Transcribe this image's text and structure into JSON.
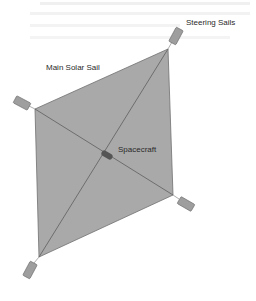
{
  "diagram": {
    "labels": {
      "steering_sails": "Steering Sails",
      "main_solar_sail": "Main Solar Sail",
      "spacecraft": "Spacecraft"
    },
    "colors": {
      "background": "#ffffff",
      "sail_fill": "#a9a9a9",
      "sail_stroke": "#6e6e6e",
      "rigging": "#6a6a6a",
      "steering_sail_fill": "#9e9e9e",
      "spacecraft_fill": "#555555",
      "label_text": "#2a2a2a"
    },
    "main_sail_vertices": {
      "top": [
        168,
        49
      ],
      "right": [
        173,
        195
      ],
      "bottom": [
        39,
        257
      ],
      "left": [
        35,
        109
      ]
    },
    "spacecraft_position": [
      107,
      155
    ],
    "steering_sails": [
      {
        "id": "top",
        "center": [
          176,
          36
        ],
        "angle": -62
      },
      {
        "id": "left",
        "center": [
          23,
          103
        ],
        "angle": 28
      },
      {
        "id": "right",
        "center": [
          185,
          204
        ],
        "angle": 28
      },
      {
        "id": "bottom",
        "center": [
          30,
          270
        ],
        "angle": -62
      }
    ]
  }
}
